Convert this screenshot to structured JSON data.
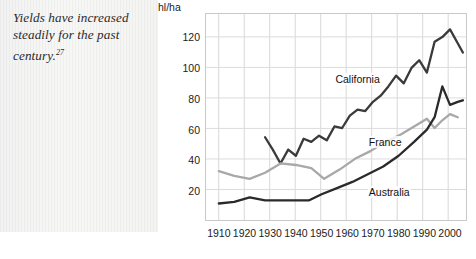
{
  "caption": {
    "text": "Yields have increased steadily for the past century.",
    "note": "27"
  },
  "chart_data": {
    "type": "line",
    "title": "",
    "xlabel": "",
    "ylabel": "hl/ha",
    "y_axis_title": "hl/ha",
    "xlim": [
      1905,
      2007
    ],
    "ylim": [
      0,
      135
    ],
    "xticks": [
      1910,
      1920,
      1930,
      1940,
      1950,
      1960,
      1970,
      1980,
      1990,
      2000
    ],
    "xtick_labels": [
      "1910",
      "1920",
      "1930",
      "1940",
      "1950",
      "1960",
      "1970",
      "1980",
      "1990",
      "2000"
    ],
    "yticks": [
      20,
      40,
      60,
      80,
      100,
      120
    ],
    "ytick_labels": [
      "20",
      "40",
      "60",
      "80",
      "100",
      "120"
    ],
    "grid": true,
    "legend": "inline-labels",
    "series": [
      {
        "name": "California",
        "color": "#3a3a3a",
        "width": 2.3,
        "label_x": 1955,
        "label_y": 92,
        "x": [
          1928,
          1931,
          1934,
          1937,
          1940,
          1943,
          1946,
          1949,
          1952,
          1955,
          1958,
          1961,
          1964,
          1967,
          1970,
          1973,
          1976,
          1979,
          1982,
          1985,
          1988,
          1991,
          1994,
          1997,
          2000,
          2003,
          2005
        ],
        "y": [
          55,
          47,
          38,
          47,
          43,
          54,
          52,
          56,
          53,
          62,
          61,
          69,
          73,
          72,
          78,
          82,
          88,
          95,
          90,
          100,
          105,
          97,
          117,
          120,
          125,
          116,
          110
        ]
      },
      {
        "name": "France",
        "color": "#a8a8a8",
        "width": 2.3,
        "label_x": 1968,
        "label_y": 51,
        "x": [
          1910,
          1916,
          1922,
          1928,
          1934,
          1940,
          1946,
          1951,
          1957,
          1963,
          1969,
          1975,
          1981,
          1987,
          1991,
          1994,
          1997,
          2000,
          2003
        ],
        "y": [
          33,
          30,
          28,
          32,
          38,
          37,
          35,
          28,
          34,
          41,
          46,
          52,
          57,
          63,
          67,
          61,
          66,
          70,
          68
        ]
      },
      {
        "name": "Australia",
        "color": "#2a2a2a",
        "width": 2.3,
        "label_x": 1968,
        "label_y": 19,
        "x": [
          1910,
          1916,
          1922,
          1928,
          1934,
          1940,
          1945,
          1950,
          1956,
          1962,
          1968,
          1974,
          1980,
          1986,
          1991,
          1994,
          1997,
          2000,
          2003,
          2005
        ],
        "y": [
          12,
          13,
          16,
          14,
          14,
          14,
          14,
          18,
          22,
          26,
          31,
          36,
          43,
          52,
          60,
          68,
          88,
          76,
          78,
          79
        ]
      }
    ]
  }
}
